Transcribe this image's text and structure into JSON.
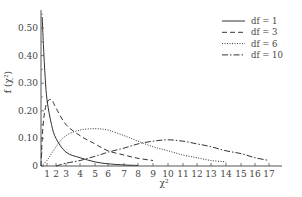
{
  "chart_data": {
    "type": "line",
    "title": "",
    "xlabel": "χ²",
    "ylabel": "f (χ²)",
    "xlim": [
      0,
      18
    ],
    "ylim": [
      0,
      0.55
    ],
    "grid": false,
    "legend_position": "top-right",
    "x_ticks": [
      1,
      2,
      3,
      4,
      5,
      6,
      7,
      8,
      9,
      10,
      11,
      12,
      13,
      14,
      15,
      16,
      17
    ],
    "y_ticks": [
      {
        "value": 0,
        "label": "0"
      },
      {
        "value": 0.1,
        "label": "0.10"
      },
      {
        "value": 0.2,
        "label": "0.20"
      },
      {
        "value": 0.3,
        "label": "0.30"
      },
      {
        "value": 0.4,
        "label": "0.40"
      },
      {
        "value": 0.5,
        "label": "0.50"
      }
    ],
    "series": [
      {
        "name": "df = 1",
        "style": "solid",
        "x": [
          0.2,
          0.4,
          0.7,
          1.0,
          1.5,
          2.0,
          3.0,
          4.0,
          5.0,
          6.0,
          7.0,
          8.0
        ],
        "values": [
          0.54,
          0.44,
          0.32,
          0.24,
          0.15,
          0.1,
          0.05,
          0.03,
          0.015,
          0.008,
          0.004,
          0.002
        ]
      },
      {
        "name": "df = 3",
        "style": "dashed",
        "x": [
          0.0,
          0.2,
          0.5,
          1.0,
          1.5,
          2.0,
          3.0,
          4.0,
          5.0,
          6.0,
          7.0,
          8.0,
          9.0
        ],
        "values": [
          0.0,
          0.1,
          0.18,
          0.23,
          0.24,
          0.21,
          0.15,
          0.11,
          0.08,
          0.055,
          0.04,
          0.028,
          0.02
        ]
      },
      {
        "name": "df = 6",
        "style": "dotted",
        "x": [
          0.0,
          1.0,
          2.0,
          3.0,
          4.0,
          5.0,
          6.0,
          7.0,
          8.0,
          9.0,
          10.0,
          11.0,
          12.0,
          13.0,
          14.0
        ],
        "values": [
          0.0,
          0.02,
          0.07,
          0.11,
          0.13,
          0.135,
          0.13,
          0.11,
          0.09,
          0.07,
          0.055,
          0.04,
          0.03,
          0.02,
          0.015
        ]
      },
      {
        "name": "df = 10",
        "style": "dash-dot",
        "x": [
          2.0,
          3.0,
          4.0,
          5.0,
          6.0,
          7.0,
          8.0,
          9.0,
          10.0,
          11.0,
          12.0,
          13.0,
          14.0,
          15.0,
          16.0,
          17.0
        ],
        "values": [
          0.0,
          0.01,
          0.02,
          0.035,
          0.05,
          0.065,
          0.08,
          0.09,
          0.095,
          0.09,
          0.08,
          0.07,
          0.055,
          0.045,
          0.03,
          0.02
        ]
      }
    ]
  },
  "layout": {
    "plot_left": 41,
    "plot_bottom": 166,
    "x_tick_px": {
      "1": 47,
      "2": 56,
      "3": 66,
      "4": 80,
      "5": 95,
      "6": 108,
      "7": 124,
      "8": 138,
      "9": 153,
      "10": 168,
      "11": 183,
      "12": 197,
      "13": 211,
      "14": 226,
      "15": 241,
      "16": 255,
      "17": 269
    },
    "px_per_y_unit": 276,
    "axis_color": "#555555",
    "line_color": "#333333"
  }
}
